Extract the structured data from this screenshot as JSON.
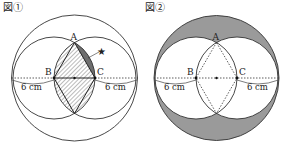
{
  "figure1": {
    "title": "図①",
    "labels": {
      "A": "A",
      "B": "B",
      "C": "C",
      "star": "★"
    },
    "left_measure": "6 cm",
    "right_measure": "6 cm"
  },
  "figure2": {
    "title": "図②",
    "labels": {
      "A": "A",
      "B": "B",
      "C": "C"
    },
    "left_measure": "6 cm",
    "right_measure": "6 cm"
  },
  "colors": {
    "stroke": "#333333",
    "shade_gray": "#9a9a9a",
    "dark_segment": "#6e6e6e",
    "hatch": "#555555"
  }
}
